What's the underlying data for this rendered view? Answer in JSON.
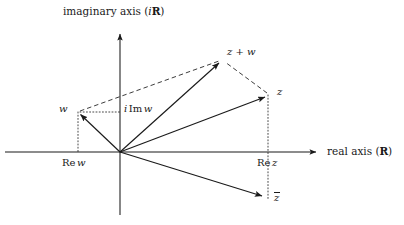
{
  "figure": {
    "background": "#ffffff",
    "stroke_color": "#1a1a1a",
    "text_color": "#1a1a1a",
    "width": 404,
    "height": 225
  },
  "axes": {
    "imaginary": {
      "label_prefix": "imaginary axis (",
      "label_symbol_i": "i",
      "label_symbol_set": "R",
      "label_suffix": ")",
      "label_full": "imaginary axis (iR)",
      "x": 120,
      "top_y": 30,
      "bottom_y": 215,
      "arrow_at": "top"
    },
    "real": {
      "label_prefix": "real axis (",
      "label_symbol_set": "R",
      "label_suffix": ")",
      "label_full": "real axis (R)",
      "y": 152,
      "left_x": 5,
      "right_x": 322,
      "arrow_at": "right"
    },
    "origin": {
      "x": 120,
      "y": 152
    }
  },
  "vectors": [
    {
      "name": "w",
      "label": "w",
      "x": 78,
      "y": 112,
      "style": "solid",
      "arrow": true
    },
    {
      "name": "z",
      "label": "z",
      "x": 268,
      "y": 95,
      "style": "solid",
      "arrow": true
    },
    {
      "name": "zpw",
      "label": "z + w",
      "x": 222,
      "y": 60,
      "style": "solid",
      "arrow": true
    },
    {
      "name": "zbar",
      "label": "z",
      "x": 265,
      "y": 198,
      "style": "solid",
      "arrow": true,
      "overbar": true
    }
  ],
  "dashed_edges": [
    {
      "name": "w-to-zpw",
      "from_x": 78,
      "from_y": 112,
      "to_x": 222,
      "to_y": 60
    },
    {
      "name": "z-to-zpw",
      "from_x": 268,
      "from_y": 95,
      "to_x": 222,
      "to_y": 60
    }
  ],
  "projections": [
    {
      "name": "re-w",
      "label_prefix": "Re",
      "label_symbol": "w",
      "label_full": "Re w",
      "label_x": 63,
      "label_y": 158,
      "drop_x": 78,
      "drop_from_y": 112,
      "drop_to_y": 152
    },
    {
      "name": "re-z",
      "label_prefix": "Re",
      "label_symbol": "z",
      "label_full": "Re z",
      "label_x": 258,
      "label_y": 158,
      "drop_x": 268,
      "drop_from_y": 95,
      "drop_to_y": 198
    },
    {
      "name": "i-im-w",
      "label_prefix": "i",
      "label_mid": "Im",
      "label_symbol": "w",
      "label_full": "i Im w",
      "label_x": 112,
      "label_y": 104,
      "line_from_x": 78,
      "line_to_x": 120,
      "line_y": 112
    }
  ],
  "point_labels": [
    {
      "name": "label-w",
      "text": "w",
      "x": 60,
      "y": 105
    },
    {
      "name": "label-z",
      "text": "z",
      "x": 276,
      "y": 88
    },
    {
      "name": "label-zpw",
      "text": "z + w",
      "x": 228,
      "y": 48
    },
    {
      "name": "label-zbar",
      "text": "z",
      "x": 273,
      "y": 192
    }
  ]
}
